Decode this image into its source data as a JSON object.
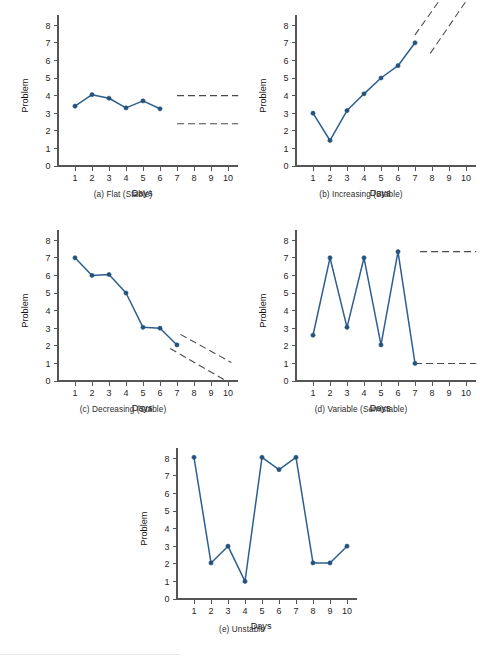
{
  "figure": {
    "title": "",
    "axis_labels": {
      "x": "Days",
      "y": "Problem"
    },
    "y_ticks": [
      "0",
      "1",
      "2",
      "3",
      "4",
      "5",
      "6",
      "7",
      "8"
    ],
    "x_ticks": [
      "1",
      "2",
      "3",
      "4",
      "5",
      "6",
      "7",
      "8",
      "9",
      "10"
    ],
    "line_color": "#2d5f8f",
    "point_color": "#24527c",
    "projection_color": "#4a4a4a"
  },
  "chart_data": [
    {
      "id": "panel-a",
      "type": "line",
      "title": "(a) Flat (Stable)",
      "xlabel": "Days",
      "ylabel": "Problem",
      "xlim": [
        0,
        10.6
      ],
      "ylim": [
        0,
        8.6
      ],
      "grid": false,
      "legend": "none",
      "x": [
        1,
        2,
        3,
        4,
        5,
        6
      ],
      "values": [
        3.4,
        4.05,
        3.85,
        3.3,
        3.7,
        3.25
      ],
      "annotations": [
        {
          "kind": "projection",
          "style": "dashed",
          "x": [
            7,
            10.6
          ],
          "y": [
            4.0,
            4.0
          ]
        },
        {
          "kind": "projection",
          "style": "dashed",
          "x": [
            7,
            10.6
          ],
          "y": [
            2.4,
            2.4
          ]
        }
      ]
    },
    {
      "id": "panel-b",
      "type": "line",
      "title": "(b) Increasing (Stable)",
      "xlabel": "Days",
      "ylabel": "Problem",
      "xlim": [
        0,
        10.6
      ],
      "ylim": [
        0,
        8.6
      ],
      "grid": false,
      "legend": "none",
      "x": [
        1,
        2,
        3,
        4,
        5,
        6,
        7
      ],
      "values": [
        3.0,
        1.45,
        3.15,
        4.1,
        5.0,
        5.7,
        7.0
      ],
      "annotations": [
        {
          "kind": "projection",
          "style": "dashed",
          "x": [
            7.0,
            9.1
          ],
          "y": [
            7.45,
            10.3
          ]
        },
        {
          "kind": "projection",
          "style": "dashed",
          "x": [
            7.9,
            10.1
          ],
          "y": [
            6.4,
            9.5
          ]
        }
      ]
    },
    {
      "id": "panel-c",
      "type": "line",
      "title": "(c) Decreasing (Stable)",
      "xlabel": "Days",
      "ylabel": "Problem",
      "xlim": [
        0,
        10.6
      ],
      "ylim": [
        0,
        8.6
      ],
      "grid": false,
      "legend": "none",
      "x": [
        1,
        2,
        3,
        4,
        5,
        6,
        7
      ],
      "values": [
        7.0,
        6.0,
        6.05,
        5.0,
        3.05,
        3.0,
        2.05
      ],
      "annotations": [
        {
          "kind": "projection",
          "style": "dashed",
          "x": [
            7.2,
            10.2
          ],
          "y": [
            2.65,
            1.05
          ]
        },
        {
          "kind": "projection",
          "style": "dashed",
          "x": [
            6.6,
            9.9
          ],
          "y": [
            1.85,
            0.0
          ]
        }
      ]
    },
    {
      "id": "panel-d",
      "type": "line",
      "title": "(d) Variable (Semistable)",
      "xlabel": "Days",
      "ylabel": "Problem",
      "xlim": [
        0,
        10.6
      ],
      "ylim": [
        0,
        8.6
      ],
      "grid": false,
      "legend": "none",
      "x": [
        1,
        2,
        3,
        4,
        5,
        6,
        7
      ],
      "values": [
        2.6,
        7.0,
        3.05,
        7.0,
        2.05,
        7.35,
        1.0
      ],
      "annotations": [
        {
          "kind": "projection",
          "style": "dashed",
          "x": [
            7.3,
            10.6
          ],
          "y": [
            7.35,
            7.35
          ]
        },
        {
          "kind": "projection",
          "style": "dashed",
          "x": [
            7.0,
            10.6
          ],
          "y": [
            1.0,
            1.0
          ]
        }
      ]
    },
    {
      "id": "panel-e",
      "type": "line",
      "title": "(e) Unstable",
      "xlabel": "Days",
      "ylabel": "Problem",
      "xlim": [
        0,
        10.6
      ],
      "ylim": [
        0,
        8.6
      ],
      "grid": false,
      "legend": "none",
      "x": [
        1,
        2,
        3,
        4,
        5,
        6,
        7,
        8,
        9,
        10
      ],
      "values": [
        8.05,
        2.05,
        3.0,
        1.0,
        8.05,
        7.35,
        8.05,
        2.05,
        2.05,
        3.0
      ],
      "annotations": []
    }
  ]
}
